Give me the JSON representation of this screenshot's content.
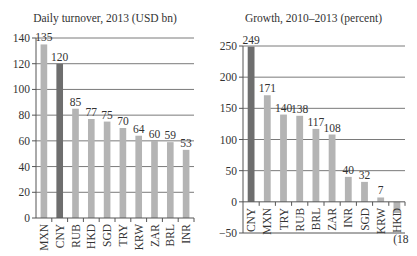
{
  "chart_data": [
    {
      "type": "bar",
      "title": "Daily turnover, 2013 (USD bn)",
      "xlabel": "",
      "ylabel": "",
      "categories": [
        "MXN",
        "CNY",
        "RUB",
        "HKD",
        "SGD",
        "TRY",
        "KRW",
        "ZAR",
        "BRL",
        "INR"
      ],
      "values": [
        135,
        120,
        85,
        77,
        75,
        70,
        64,
        60,
        59,
        53
      ],
      "value_labels": [
        "135",
        "120",
        "85",
        "77",
        "75",
        "70",
        "64",
        "60",
        "59",
        "53"
      ],
      "highlight": "CNY",
      "ylim": [
        0,
        140
      ],
      "yticks": [
        0,
        20,
        40,
        60,
        80,
        100,
        120,
        140
      ],
      "grid": true,
      "legend": null
    },
    {
      "type": "bar",
      "title": "Growth, 2010–2013 (percent)",
      "xlabel": "",
      "ylabel": "",
      "categories": [
        "CNY",
        "MXN",
        "TRY",
        "RUB",
        "BRL",
        "ZAR",
        "INR",
        "SGD",
        "KRW",
        "HKD"
      ],
      "values": [
        249,
        171,
        140,
        138,
        117,
        108,
        40,
        32,
        7,
        -18
      ],
      "value_labels": [
        "249",
        "171",
        "140",
        "138",
        "117",
        "108",
        "40",
        "32",
        "7",
        "(18"
      ],
      "highlight": "CNY",
      "ylim": [
        -50,
        250
      ],
      "yticks": [
        -50,
        0,
        50,
        100,
        150,
        200,
        250
      ],
      "grid": true,
      "legend": null
    }
  ],
  "colors": {
    "bar": "#b4b4b4",
    "highlight": "#6e6e6e",
    "grid": "#7a7a7a",
    "axis": "#555555",
    "text": "#333333"
  }
}
